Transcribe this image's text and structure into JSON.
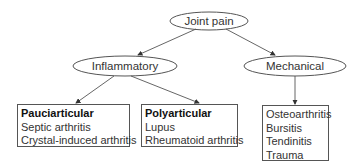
{
  "diagram": {
    "root": {
      "label": "Joint pain"
    },
    "level1": [
      {
        "label": "Inflammatory"
      },
      {
        "label": "Mechanical"
      }
    ],
    "leaves": {
      "pauciarticular": {
        "heading": "Pauciarticular",
        "items": [
          "Septic arthritis",
          "Crystal-induced arthritis"
        ]
      },
      "polyarticular": {
        "heading": "Polyarticular",
        "items": [
          "Lupus",
          "Rheumatoid arthritis"
        ]
      },
      "mechanical": {
        "items": [
          "Osteoarthritis",
          "Bursitis",
          "Tendinitis",
          "Trauma"
        ]
      }
    }
  }
}
